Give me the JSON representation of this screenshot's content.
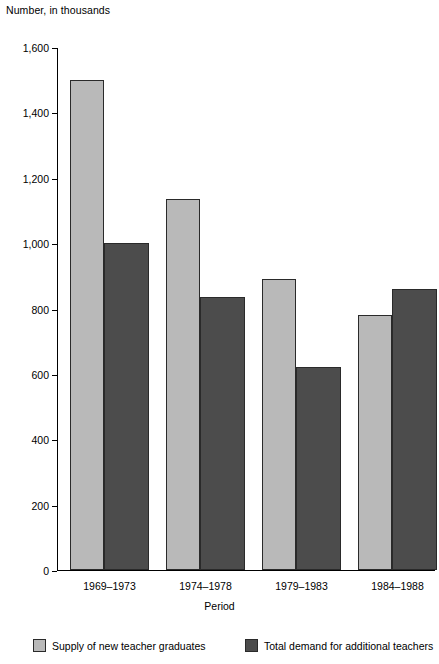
{
  "chart_data": {
    "type": "bar",
    "title": "",
    "ylabel": "Number, in thousands",
    "xlabel": "Period",
    "categories": [
      "1969–1973",
      "1974–1978",
      "1979–1983",
      "1984–1988"
    ],
    "series": [
      {
        "name": "Supply of new teacher graduates",
        "color": "#b9b9b9",
        "values": [
          1500,
          1135,
          890,
          780
        ]
      },
      {
        "name": "Total demand for additional teachers",
        "color": "#4c4c4c",
        "values": [
          1000,
          835,
          620,
          860
        ]
      }
    ],
    "ylim": [
      0,
      1600
    ],
    "yticks": [
      0,
      200,
      400,
      600,
      800,
      1000,
      1200,
      1400,
      1600
    ],
    "ytick_labels": [
      "0",
      "200",
      "400",
      "600",
      "800",
      "1,000",
      "1,200",
      "1,400",
      "1,600"
    ],
    "grid": false,
    "legend_position": "bottom"
  },
  "colors": {
    "supply": "#b9b9b9",
    "demand": "#4c4c4c",
    "axis": "#000000",
    "bar_outline": "#2a2a2a",
    "background": "#ffffff"
  }
}
